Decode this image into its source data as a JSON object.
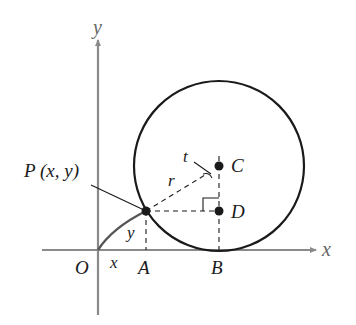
{
  "diagram": {
    "type": "geometry",
    "colors": {
      "axis": "#8a8a8a",
      "curve": "#1a1a1a",
      "text": "#1a1a1a",
      "axis_label": "#666666"
    },
    "axes": {
      "x_label": "x",
      "y_label": "y",
      "origin_label": "O"
    },
    "points": {
      "P": {
        "label": "P (x, y)"
      },
      "A": {
        "label": "A"
      },
      "B": {
        "label": "B"
      },
      "C": {
        "label": "C"
      },
      "D": {
        "label": "D"
      }
    },
    "segment_labels": {
      "x": "x",
      "y": "y",
      "r": "r",
      "t": "t"
    }
  }
}
